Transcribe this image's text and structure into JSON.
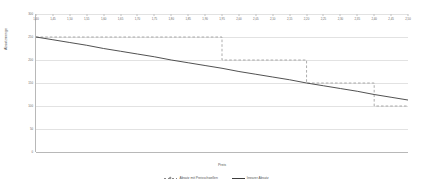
{
  "chart_data": {
    "type": "line",
    "title": "",
    "xlabel": "Preis",
    "ylabel": "Absatzmenge",
    "xlim": [
      1.4,
      2.5
    ],
    "ylim": [
      0,
      300
    ],
    "grid": true,
    "legend_position": "bottom",
    "yticks": [
      0,
      50,
      100,
      150,
      200,
      250,
      300
    ],
    "ytick_labels": [
      "0",
      "50",
      "100",
      "150",
      "200",
      "250",
      "300"
    ],
    "x": [
      1.4,
      1.45,
      1.5,
      1.55,
      1.6,
      1.65,
      1.7,
      1.75,
      1.8,
      1.85,
      1.9,
      1.95,
      2.0,
      2.05,
      2.1,
      2.15,
      2.2,
      2.25,
      2.3,
      2.35,
      2.4,
      2.45,
      2.5
    ],
    "xtick_labels": [
      "1,40",
      "1,45",
      "1,50",
      "1,55",
      "1,60",
      "1,65",
      "1,70",
      "1,75",
      "1,80",
      "1,85",
      "1,90",
      "1,95",
      "2,00",
      "2,05",
      "2,10",
      "2,15",
      "2,20",
      "2,25",
      "2,30",
      "2,35",
      "2,40",
      "2,45",
      "2,50"
    ],
    "series": [
      {
        "name": "Absatz mit Preisschwellen",
        "style": "dashed-step",
        "color": "#8a8a8a",
        "values": [
          250,
          250,
          250,
          250,
          250,
          250,
          250,
          250,
          250,
          250,
          250,
          200,
          200,
          200,
          200,
          200,
          150,
          150,
          150,
          150,
          100,
          100,
          100
        ]
      },
      {
        "name": "linearer Absatz",
        "style": "solid",
        "color": "#3d3d3d",
        "values": [
          250,
          244,
          238,
          232,
          225,
          219,
          213,
          207,
          200,
          194,
          188,
          182,
          175,
          169,
          163,
          157,
          150,
          144,
          138,
          132,
          125,
          119,
          113
        ]
      }
    ]
  },
  "legend": {
    "items": [
      {
        "label": "Absatz mit Preisschwellen"
      },
      {
        "label": "linearer Absatz"
      }
    ]
  }
}
